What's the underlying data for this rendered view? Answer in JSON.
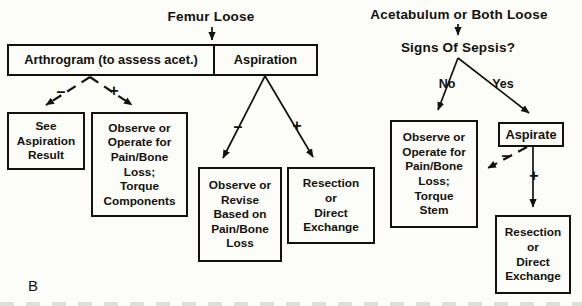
{
  "colors": {
    "ink": "#14110c",
    "paper": "#fcfcf9"
  },
  "figure": {
    "label": "B"
  },
  "femur": {
    "title": "Femur Loose",
    "arthrogram_cell": "Arthrogram\n(to assess acet.)",
    "aspiration_cell": "Aspiration",
    "arthrogram_minus": "–",
    "arthrogram_plus": "+",
    "see_aspiration_box": "See\nAspiration\nResult",
    "observe_components_box": "Observe or\nOperate for\nPain/Bone\nLoss;\nTorque\nComponents",
    "aspiration_minus": "–",
    "aspiration_plus": "+",
    "observe_revise_box": "Observe or\nRevise\nBased on\nPain/Bone\nLoss",
    "resection_box": "Resection\nor\nDirect\nExchange"
  },
  "acetabulum": {
    "title": "Acetabulum or Both Loose",
    "question": "Signs Of Sepsis?",
    "no_label": "No",
    "yes_label": "Yes",
    "observe_stem_box": "Observe or\nOperate for\nPain/Bone\nLoss;\nTorque\nStem",
    "aspirate_box": "Aspirate",
    "aspirate_minus": "–",
    "aspirate_plus": "+",
    "resection_box": "Resection\nor\nDirect\nExchange"
  }
}
